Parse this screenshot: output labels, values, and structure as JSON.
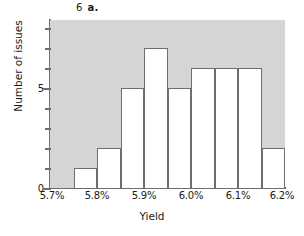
{
  "title": {
    "number": "6",
    "part": "a."
  },
  "chart_data": {
    "type": "bar",
    "xlabel": "Yield",
    "ylabel": "Number of issues",
    "categories": [
      "5.70%",
      "5.75%",
      "5.80%",
      "5.85%",
      "5.90%",
      "5.95%",
      "6.00%",
      "6.05%",
      "6.10%",
      "6.15%"
    ],
    "bin_edges": [
      5.7,
      5.75,
      5.8,
      5.85,
      5.9,
      5.95,
      6.0,
      6.05,
      6.1,
      6.15,
      6.2
    ],
    "values": [
      0,
      1,
      2,
      5,
      7,
      5,
      6,
      6,
      6,
      2
    ],
    "xlim": [
      5.7,
      6.2
    ],
    "ylim": [
      0,
      8.4
    ],
    "grid": false,
    "legend": null,
    "bar_fill_color": "#ffffff",
    "bar_edge_color": "#6e6e6e",
    "plot_background_color": "#d5d5d5",
    "xtick_labels": [
      "5.7%",
      "5.8%",
      "5.9%",
      "6.0%",
      "6.1%",
      "6.2%"
    ],
    "xtick_values": [
      5.7,
      5.8,
      5.9,
      6.0,
      6.1,
      6.2
    ],
    "ytick_labels": [
      "0",
      "5"
    ],
    "ytick_values": [
      0,
      5
    ],
    "yminor_tick_values": [
      1,
      2,
      3,
      4,
      6,
      7,
      8
    ]
  }
}
